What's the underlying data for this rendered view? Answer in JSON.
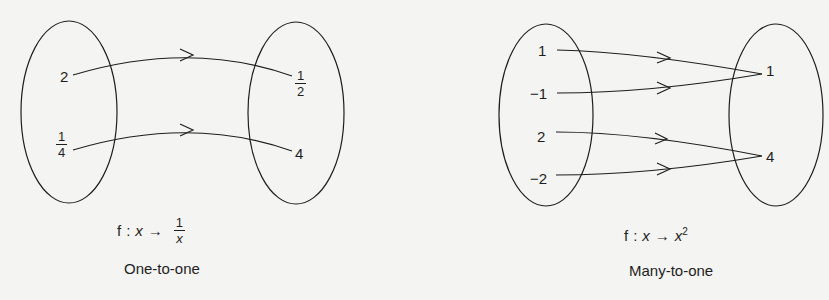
{
  "left_diagram": {
    "domain": [
      {
        "label": "2",
        "type": "integer"
      },
      {
        "numerator": "1",
        "denominator": "4",
        "type": "fraction"
      }
    ],
    "codomain": [
      {
        "numerator": "1",
        "denominator": "2",
        "type": "fraction"
      },
      {
        "label": "4",
        "type": "integer"
      }
    ],
    "mappings": [
      [
        "2",
        "1/2"
      ],
      [
        "1/4",
        "4"
      ]
    ],
    "formula": {
      "f": "f",
      "colon": ":",
      "var": "x",
      "arrow": "→",
      "result_num": "1",
      "result_den": "x"
    },
    "caption": "One-to-one"
  },
  "right_diagram": {
    "domain": [
      {
        "label": "1"
      },
      {
        "label": "−1"
      },
      {
        "label": "2"
      },
      {
        "label": "−2"
      }
    ],
    "codomain": [
      {
        "label": "1"
      },
      {
        "label": "4"
      }
    ],
    "mappings": [
      [
        "1",
        "1"
      ],
      [
        "−1",
        "1"
      ],
      [
        "2",
        "4"
      ],
      [
        "−2",
        "4"
      ]
    ],
    "formula": {
      "f": "f",
      "colon": ":",
      "var": "x",
      "arrow": "→",
      "result": "x",
      "exponent": "2"
    },
    "caption": "Many-to-one"
  },
  "colors": {
    "line": "#1e1e1e",
    "background": "#f4f4f2"
  }
}
